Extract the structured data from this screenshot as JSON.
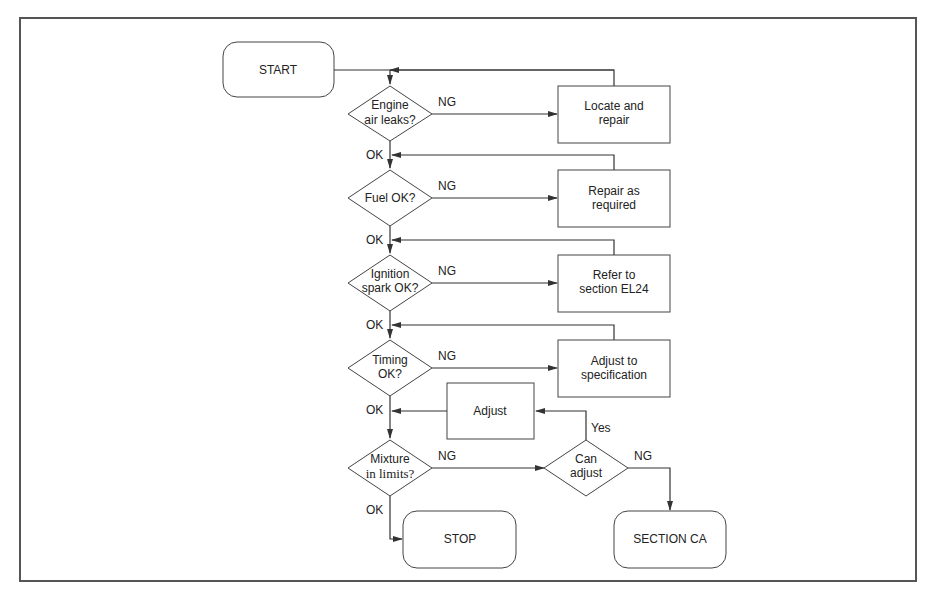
{
  "diagram": {
    "type": "flowchart",
    "terminals": {
      "start": "START",
      "stop": "STOP",
      "section_ca": "SECTION CA"
    },
    "decisions": [
      {
        "id": "air",
        "lines": [
          "Engine",
          "air leaks?"
        ]
      },
      {
        "id": "fuel",
        "lines": [
          "Fuel OK?"
        ]
      },
      {
        "id": "ignition",
        "lines": [
          "Ignition",
          "spark OK?"
        ]
      },
      {
        "id": "timing",
        "lines": [
          "Timing",
          "OK?"
        ]
      },
      {
        "id": "mixture",
        "lines": [
          "Mixture",
          "in limits?"
        ]
      },
      {
        "id": "can_adjust",
        "lines": [
          "Can",
          "adjust"
        ]
      }
    ],
    "processes": [
      {
        "id": "locate",
        "lines": [
          "Locate and",
          "repair"
        ]
      },
      {
        "id": "repair",
        "lines": [
          "Repair as",
          "required"
        ]
      },
      {
        "id": "refer",
        "lines": [
          "Refer to",
          "section EL24"
        ]
      },
      {
        "id": "adjust_spec",
        "lines": [
          "Adjust to",
          "specification"
        ]
      },
      {
        "id": "adjust",
        "lines": [
          "Adjust"
        ]
      }
    ],
    "labels": {
      "ng": "NG",
      "ok": "OK",
      "yes": "Yes"
    }
  }
}
